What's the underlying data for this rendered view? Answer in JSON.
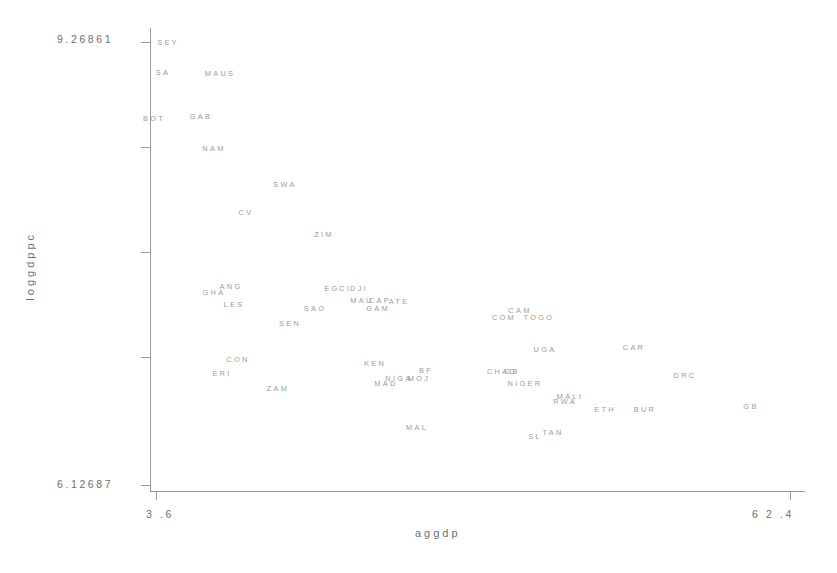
{
  "chart_data": {
    "type": "scatter",
    "title": "",
    "xlabel": "aggdp",
    "ylabel": "loggdppc",
    "xlim": [
      3.6,
      62.4
    ],
    "ylim": [
      6.12687,
      9.26861
    ],
    "xticks": [
      "3.6",
      "62.4"
    ],
    "yticks": [
      "9.26861",
      "6.12687"
    ],
    "grid": false,
    "legend": null,
    "marker_style": "text-label",
    "points": [
      {
        "label": "SEY",
        "x": 5.0,
        "y": 9.255,
        "px": 168,
        "py": 42
      },
      {
        "label": "SA",
        "x": 4.5,
        "y": 9.057,
        "px": 163,
        "py": 72
      },
      {
        "label": "MAUS",
        "x": 9.6,
        "y": 9.05,
        "px": 220,
        "py": 73
      },
      {
        "label": "BOT",
        "x": 3.7,
        "y": 8.749,
        "px": 154,
        "py": 118
      },
      {
        "label": "GAB",
        "x": 7.9,
        "y": 8.761,
        "px": 201,
        "py": 116
      },
      {
        "label": "NAM",
        "x": 9.1,
        "y": 8.546,
        "px": 214,
        "py": 148
      },
      {
        "label": "SWA",
        "x": 15.5,
        "y": 8.303,
        "px": 285,
        "py": 184
      },
      {
        "label": "CV",
        "x": 12.0,
        "y": 8.113,
        "px": 246,
        "py": 212
      },
      {
        "label": "ZIM",
        "x": 19.0,
        "y": 7.965,
        "px": 324,
        "py": 234
      },
      {
        "label": "ANG",
        "x": 10.6,
        "y": 7.612,
        "px": 231,
        "py": 286
      },
      {
        "label": "GHA",
        "x": 9.1,
        "y": 7.572,
        "px": 214,
        "py": 292
      },
      {
        "label": "EG",
        "x": 19.7,
        "y": 7.599,
        "px": 332,
        "py": 288
      },
      {
        "label": "CI",
        "x": 20.9,
        "y": 7.599,
        "px": 345,
        "py": 288
      },
      {
        "label": "DJI",
        "x": 22.2,
        "y": 7.599,
        "px": 359,
        "py": 288
      },
      {
        "label": "LES",
        "x": 10.9,
        "y": 7.518,
        "px": 234,
        "py": 304
      },
      {
        "label": "MAU",
        "x": 22.5,
        "y": 7.545,
        "px": 362,
        "py": 300
      },
      {
        "label": "CAP",
        "x": 24.1,
        "y": 7.545,
        "px": 380,
        "py": 300
      },
      {
        "label": "ATE",
        "x": 25.8,
        "y": 7.538,
        "px": 399,
        "py": 301
      },
      {
        "label": "SAO",
        "x": 18.2,
        "y": 7.491,
        "px": 315,
        "py": 308
      },
      {
        "label": "GAM",
        "x": 23.9,
        "y": 7.491,
        "px": 378,
        "py": 308
      },
      {
        "label": "CAM",
        "x": 36.7,
        "y": 7.477,
        "px": 520,
        "py": 310
      },
      {
        "label": "COM",
        "x": 35.2,
        "y": 7.43,
        "px": 504,
        "py": 317
      },
      {
        "label": "TOGO",
        "x": 38.4,
        "y": 7.43,
        "px": 539,
        "py": 317
      },
      {
        "label": "SEN",
        "x": 15.9,
        "y": 7.39,
        "px": 290,
        "py": 323
      },
      {
        "label": "UGA",
        "x": 38.9,
        "y": 7.214,
        "px": 545,
        "py": 349
      },
      {
        "label": "CAR",
        "x": 46.9,
        "y": 7.227,
        "px": 634,
        "py": 347
      },
      {
        "label": "CON",
        "x": 11.3,
        "y": 7.147,
        "px": 238,
        "py": 359
      },
      {
        "label": "KEN",
        "x": 23.6,
        "y": 7.119,
        "px": 375,
        "py": 363
      },
      {
        "label": "ERI",
        "x": 9.9,
        "y": 7.052,
        "px": 222,
        "py": 373
      },
      {
        "label": "BF",
        "x": 28.2,
        "y": 7.072,
        "px": 426,
        "py": 370
      },
      {
        "label": "CHAD",
        "x": 35.0,
        "y": 7.065,
        "px": 502,
        "py": 371
      },
      {
        "label": "GB",
        "x": 35.9,
        "y": 7.065,
        "px": 512,
        "py": 371
      },
      {
        "label": "NIGA",
        "x": 25.8,
        "y": 7.018,
        "px": 399,
        "py": 378
      },
      {
        "label": "MOJ",
        "x": 27.6,
        "y": 7.018,
        "px": 419,
        "py": 378
      },
      {
        "label": "MAD",
        "x": 24.6,
        "y": 6.985,
        "px": 386,
        "py": 383
      },
      {
        "label": "NIGER",
        "x": 37.2,
        "y": 6.985,
        "px": 525,
        "py": 383
      },
      {
        "label": "ZAM",
        "x": 15.0,
        "y": 6.952,
        "px": 278,
        "py": 388
      },
      {
        "label": "DRC",
        "x": 51.5,
        "y": 7.038,
        "px": 685,
        "py": 375
      },
      {
        "label": "MALI",
        "x": 41.3,
        "y": 6.899,
        "px": 570,
        "py": 396
      },
      {
        "label": "RWA",
        "x": 40.8,
        "y": 6.865,
        "px": 565,
        "py": 401
      },
      {
        "label": "GB2",
        "x": 57.5,
        "y": 6.832,
        "px": 751,
        "py": 406
      },
      {
        "label": "ETH",
        "x": 44.4,
        "y": 6.812,
        "px": 605,
        "py": 409
      },
      {
        "label": "BUR",
        "x": 48.0,
        "y": 6.812,
        "px": 645,
        "py": 409
      },
      {
        "label": "MAL",
        "x": 27.4,
        "y": 6.704,
        "px": 417,
        "py": 427
      },
      {
        "label": "TAN",
        "x": 39.7,
        "y": 6.677,
        "px": 553,
        "py": 432
      },
      {
        "label": "SL",
        "x": 38.1,
        "y": 6.65,
        "px": 535,
        "py": 436
      }
    ]
  },
  "axes": {
    "y_max_label": "9.26861",
    "y_min_label": "6.12687",
    "x_min_label": "3 .6",
    "x_max_label": "6 2 .4",
    "x_title": "aggdp",
    "y_title": "loggdppc"
  },
  "style": {
    "axis_color": "#9a9a9a",
    "label_color": "#9b9b9b",
    "tick_text_color": "#6f6f6f",
    "background": "#ffffff"
  }
}
